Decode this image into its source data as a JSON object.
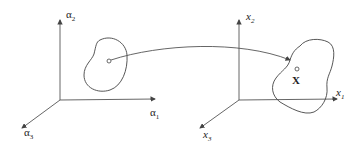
{
  "diagram": {
    "left_frame": {
      "axis_labels": {
        "vertical": "α",
        "vertical_sub": "2",
        "horizontal": "α",
        "horizontal_sub": "1",
        "depth": "α",
        "depth_sub": "3"
      }
    },
    "right_frame": {
      "axis_labels": {
        "vertical": "x",
        "vertical_sub": "2",
        "horizontal": "x",
        "horizontal_sub": "1",
        "depth": "x",
        "depth_sub": "3"
      },
      "point_label": "X"
    },
    "colors": {
      "stroke": "#444444",
      "text": "#222222",
      "background": "#ffffff"
    }
  }
}
